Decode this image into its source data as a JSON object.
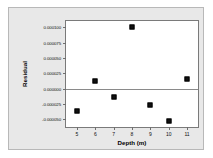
{
  "chart_data": {
    "type": "scatter",
    "title": "",
    "xlabel": "Depth (m)",
    "ylabel": "Residual",
    "xlim": [
      4.4,
      11.6
    ],
    "ylim": [
      -6.25e-05,
      0.00011
    ],
    "grid": false,
    "legend": "none",
    "zero_reference_line": 0.0,
    "x_ticks": [
      5,
      6,
      7,
      8,
      9,
      10,
      11
    ],
    "x_tick_labels": [
      "5",
      "6",
      "7",
      "8",
      "9",
      "10",
      "11"
    ],
    "y_ticks": [
      0.0001,
      7.5e-05,
      5e-05,
      2.5e-05,
      0.0,
      -2.5e-05,
      -5e-05
    ],
    "y_tick_labels": [
      "0.000100",
      "0.000075",
      "0.000050",
      "0.000025",
      "0.000000",
      "-0.000025",
      "-0.000050"
    ],
    "x": [
      5,
      6,
      7,
      8,
      9,
      10,
      11
    ],
    "values": [
      -3.7e-05,
      1.3e-05,
      -1.3e-05,
      0.0001,
      -2.6e-05,
      -5.3e-05,
      1.5e-05
    ],
    "points": [
      {
        "x": 5,
        "y": -3.7e-05
      },
      {
        "x": 6,
        "y": 1.3e-05
      },
      {
        "x": 7,
        "y": -1.3e-05
      },
      {
        "x": 8,
        "y": 0.0001
      },
      {
        "x": 9,
        "y": -2.6e-05
      },
      {
        "x": 10,
        "y": -5.3e-05
      },
      {
        "x": 11,
        "y": 1.5e-05
      }
    ],
    "marker": "square",
    "marker_color": "#111111",
    "axis_color": "#7a7a7a",
    "figure_background": "#e8e8e8",
    "plot_background": "#ffffff"
  }
}
